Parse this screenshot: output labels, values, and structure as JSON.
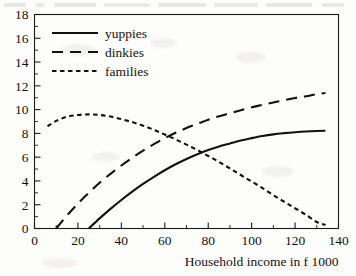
{
  "chart_data": {
    "type": "line",
    "title": "",
    "xlabel": "Household income in f 1000",
    "ylabel": "",
    "xlim": [
      0,
      140
    ],
    "ylim": [
      0,
      18
    ],
    "xticks": [
      0,
      20,
      40,
      60,
      80,
      100,
      120,
      140
    ],
    "yticks": [
      0,
      2,
      4,
      6,
      8,
      10,
      12,
      14,
      16,
      18
    ],
    "xtick_labels": [
      "0",
      "20",
      "40",
      "60",
      "80",
      "100",
      "120",
      "140"
    ],
    "ytick_labels": [
      "0",
      "2",
      "4",
      "6",
      "8",
      "10",
      "12",
      "14",
      "16",
      "18"
    ],
    "minor_xtick_step": 10,
    "minor_ytick_step": 1,
    "grid": false,
    "legend_position": "upper left",
    "series": [
      {
        "name": "yuppies",
        "style": "solid",
        "color": "#111111",
        "x": [
          25,
          30,
          35,
          40,
          45,
          50,
          55,
          60,
          65,
          70,
          75,
          80,
          85,
          90,
          95,
          100,
          105,
          110,
          115,
          120,
          125,
          130,
          134
        ],
        "y": [
          0.0,
          0.85,
          1.65,
          2.4,
          3.1,
          3.75,
          4.35,
          4.9,
          5.4,
          5.85,
          6.25,
          6.6,
          6.9,
          7.15,
          7.4,
          7.6,
          7.78,
          7.92,
          8.02,
          8.1,
          8.16,
          8.2,
          8.22
        ]
      },
      {
        "name": "dinkies",
        "style": "dashed",
        "color": "#111111",
        "x": [
          10,
          15,
          20,
          25,
          30,
          35,
          40,
          45,
          50,
          55,
          60,
          65,
          70,
          75,
          80,
          85,
          90,
          95,
          100,
          105,
          110,
          115,
          120,
          125,
          130,
          134
        ],
        "y": [
          0.0,
          1.1,
          2.1,
          3.0,
          3.85,
          4.6,
          5.3,
          5.95,
          6.55,
          7.1,
          7.6,
          8.05,
          8.45,
          8.8,
          9.15,
          9.45,
          9.7,
          9.95,
          10.2,
          10.4,
          10.6,
          10.8,
          10.98,
          11.12,
          11.3,
          11.4
        ]
      },
      {
        "name": "families",
        "style": "dotted",
        "color": "#111111",
        "x": [
          6,
          10,
          15,
          20,
          25,
          30,
          35,
          40,
          45,
          50,
          55,
          60,
          65,
          70,
          75,
          80,
          85,
          90,
          95,
          100,
          105,
          110,
          115,
          120,
          125,
          130,
          134
        ],
        "y": [
          8.6,
          9.05,
          9.4,
          9.55,
          9.6,
          9.55,
          9.42,
          9.2,
          8.95,
          8.65,
          8.3,
          7.9,
          7.5,
          7.05,
          6.6,
          6.1,
          5.6,
          5.05,
          4.5,
          3.95,
          3.4,
          2.8,
          2.25,
          1.7,
          1.15,
          0.55,
          0.3
        ]
      }
    ],
    "annotations": [
      {
        "label": "dinkies-families crossing",
        "x": 65,
        "y": 8.0
      },
      {
        "label": "yuppies-families crossing",
        "x": 86,
        "y": 6.2
      }
    ]
  },
  "legend": {
    "entries": [
      {
        "label": "yuppies",
        "style": "solid"
      },
      {
        "label": "dinkies",
        "style": "dashed"
      },
      {
        "label": "families",
        "style": "dotted"
      }
    ]
  }
}
